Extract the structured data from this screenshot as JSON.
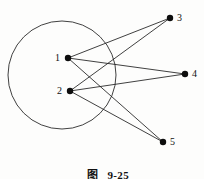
{
  "figure": {
    "caption_prefix": "图",
    "caption_index": "9-25",
    "background_color": "#fdfdfc",
    "ink_color": "#1a1a1a"
  },
  "chart_data": {
    "type": "diagram",
    "subtype": "bipartite-graph",
    "canvas": {
      "width": 204,
      "height": 179
    },
    "shapes": [
      {
        "id": "enclosing-circle",
        "kind": "circle",
        "cx": 62,
        "cy": 75,
        "r": 54,
        "stroke": "#2b2b2b",
        "stroke_width": 0.9,
        "fill": "none"
      }
    ],
    "nodes": [
      {
        "id": "1",
        "label": "1",
        "x": 68,
        "y": 58,
        "r": 3.2,
        "label_x": 55,
        "label_y": 53,
        "label_anchor": "right",
        "inside_circle": true
      },
      {
        "id": "2",
        "label": "2",
        "x": 70,
        "y": 91,
        "r": 3.2,
        "label_x": 57,
        "label_y": 86,
        "label_anchor": "right",
        "inside_circle": true
      },
      {
        "id": "3",
        "label": "3",
        "x": 170,
        "y": 18,
        "r": 3.2,
        "label_x": 177,
        "label_y": 13,
        "label_anchor": "left",
        "inside_circle": false
      },
      {
        "id": "4",
        "label": "4",
        "x": 185,
        "y": 74,
        "r": 3.2,
        "label_x": 192,
        "label_y": 69,
        "label_anchor": "left",
        "inside_circle": false
      },
      {
        "id": "5",
        "label": "5",
        "x": 163,
        "y": 142,
        "r": 3.2,
        "label_x": 170,
        "label_y": 137,
        "label_anchor": "left",
        "inside_circle": false
      }
    ],
    "edges": [
      {
        "id": "e1-3",
        "from": "1",
        "to": "3",
        "x1": 68,
        "y1": 58,
        "x2": 170,
        "y2": 18
      },
      {
        "id": "e1-4",
        "from": "1",
        "to": "4",
        "x1": 68,
        "y1": 58,
        "x2": 185,
        "y2": 74
      },
      {
        "id": "e1-5",
        "from": "1",
        "to": "5",
        "x1": 68,
        "y1": 58,
        "x2": 163,
        "y2": 142
      },
      {
        "id": "e2-3",
        "from": "2",
        "to": "3",
        "x1": 70,
        "y1": 91,
        "x2": 170,
        "y2": 18
      },
      {
        "id": "e2-4",
        "from": "2",
        "to": "4",
        "x1": 70,
        "y1": 91,
        "x2": 185,
        "y2": 74
      },
      {
        "id": "e2-5",
        "from": "2",
        "to": "5",
        "x1": 70,
        "y1": 91,
        "x2": 163,
        "y2": 142
      }
    ],
    "edge_stroke": "#1f1f1f",
    "edge_stroke_width": 0.85,
    "node_fill": "#0d0d0d"
  }
}
